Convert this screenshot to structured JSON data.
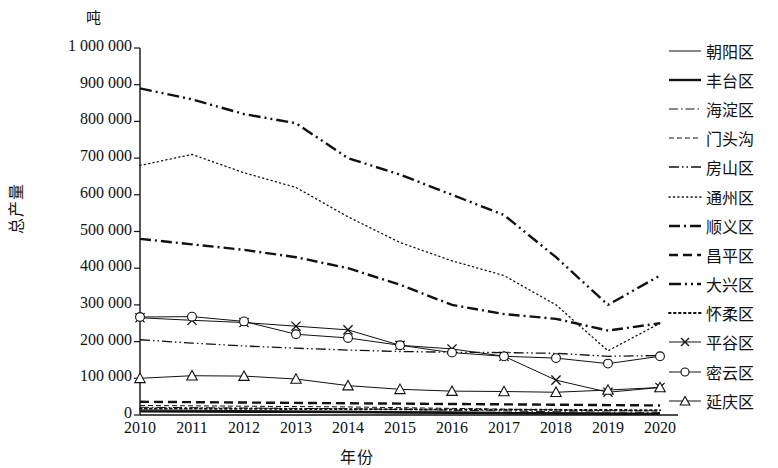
{
  "chart_data": {
    "type": "line",
    "title": "",
    "unit_label": "吨",
    "ylabel": "总产量",
    "xlabel": "年份",
    "categories": [
      "2010",
      "2011",
      "2012",
      "2013",
      "2014",
      "2015",
      "2016",
      "2017",
      "2018",
      "2019",
      "2020"
    ],
    "ylim": [
      0,
      1000000
    ],
    "ytick_labels": [
      "1 000 000",
      "900 000",
      "800 000",
      "700 000",
      "600 000",
      "500 000",
      "400 000",
      "300 000",
      "200 000",
      "100 000",
      "0"
    ],
    "ytick_values": [
      1000000,
      900000,
      800000,
      700000,
      600000,
      500000,
      400000,
      300000,
      200000,
      100000,
      0
    ],
    "grid": false,
    "legend_position": "right",
    "series": [
      {
        "name": "朝阳区",
        "style": "solid",
        "marker": "none",
        "width": 1,
        "values": [
          14000,
          13000,
          12000,
          11000,
          10000,
          9000,
          8000,
          7000,
          6000,
          5000,
          4000
        ]
      },
      {
        "name": "丰台区",
        "style": "solid",
        "marker": "none",
        "width": 2.4,
        "values": [
          10000,
          9500,
          9000,
          8500,
          8000,
          7000,
          6000,
          5000,
          4000,
          3500,
          3000
        ]
      },
      {
        "name": "海淀区",
        "style": "dashdot",
        "marker": "none",
        "width": 1,
        "values": [
          21000,
          20000,
          19000,
          18000,
          17000,
          15000,
          13000,
          11000,
          9000,
          8000,
          7000
        ]
      },
      {
        "name": "门头沟",
        "style": "dashed-fine",
        "marker": "none",
        "width": 1,
        "values": [
          26000,
          25000,
          24000,
          23000,
          22000,
          20000,
          18000,
          16000,
          14000,
          12000,
          11000
        ]
      },
      {
        "name": "房山区",
        "style": "dashdotdot",
        "marker": "none",
        "width": 1.3,
        "values": [
          205000,
          196000,
          188000,
          182000,
          177000,
          173000,
          171000,
          170000,
          168000,
          160000,
          162000
        ]
      },
      {
        "name": "通州区",
        "style": "dotted",
        "marker": "none",
        "width": 1.3,
        "values": [
          680000,
          710000,
          660000,
          620000,
          540000,
          470000,
          420000,
          380000,
          300000,
          175000,
          250000
        ]
      },
      {
        "name": "顺义区",
        "style": "dashdot-bold",
        "marker": "none",
        "width": 2.4,
        "values": [
          480000,
          465000,
          450000,
          430000,
          400000,
          355000,
          300000,
          275000,
          262000,
          230000,
          250000
        ]
      },
      {
        "name": "昌平区",
        "style": "dashed-bold",
        "marker": "none",
        "width": 2.4,
        "values": [
          36000,
          35000,
          34000,
          33000,
          32000,
          31000,
          30000,
          29000,
          28000,
          27000,
          26000
        ]
      },
      {
        "name": "大兴区",
        "style": "dashdotdot-bold",
        "marker": "none",
        "width": 2.4,
        "values": [
          890000,
          860000,
          820000,
          795000,
          700000,
          655000,
          600000,
          545000,
          430000,
          300000,
          380000
        ]
      },
      {
        "name": "怀柔区",
        "style": "dotted-bold",
        "marker": "none",
        "width": 2.0,
        "values": [
          18000,
          17500,
          17000,
          16500,
          16000,
          15500,
          15000,
          14500,
          14000,
          13500,
          13000
        ]
      },
      {
        "name": "平谷区",
        "style": "solid",
        "marker": "cross",
        "width": 1,
        "values": [
          265000,
          258000,
          252000,
          242000,
          232000,
          190000,
          180000,
          160000,
          95000,
          62000,
          75000
        ]
      },
      {
        "name": "密云区",
        "style": "solid",
        "marker": "circle",
        "width": 1,
        "values": [
          267000,
          268000,
          255000,
          220000,
          210000,
          190000,
          170000,
          160000,
          155000,
          140000,
          160000
        ]
      },
      {
        "name": "延庆区",
        "style": "solid",
        "marker": "triangle",
        "width": 1,
        "values": [
          100000,
          107000,
          106000,
          98000,
          80000,
          70000,
          65000,
          64000,
          62000,
          68000,
          75000
        ]
      }
    ]
  }
}
